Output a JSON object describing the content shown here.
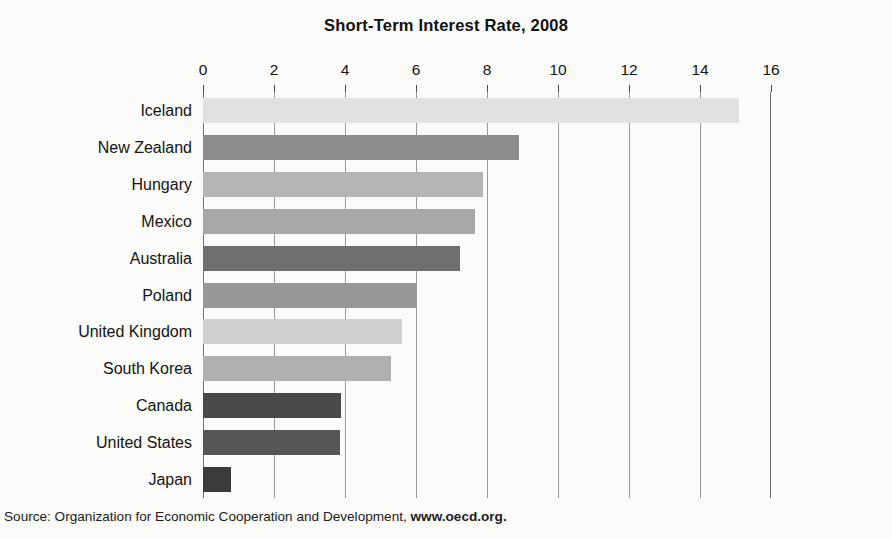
{
  "chart_data": {
    "type": "bar",
    "orientation": "horizontal",
    "title": "Short-Term Interest Rate, 2008",
    "xlabel": "",
    "ylabel": "",
    "xlim": [
      0,
      16
    ],
    "grid": true,
    "legend": false,
    "xticks": [
      "0",
      "2",
      "4",
      "6",
      "8",
      "10",
      "12",
      "14",
      "16"
    ],
    "xtick_values": [
      0,
      2,
      4,
      6,
      8,
      10,
      12,
      14,
      16
    ],
    "categories": [
      "Iceland",
      "New Zealand",
      "Hungary",
      "Mexico",
      "Australia",
      "Poland",
      "United Kingdom",
      "South Korea",
      "Canada",
      "United States",
      "Japan"
    ],
    "values": [
      15.1,
      8.9,
      7.9,
      7.65,
      7.25,
      6.0,
      5.6,
      5.3,
      3.9,
      3.85,
      0.8
    ],
    "bar_colors": [
      "#e2e2e2",
      "#8c8c8c",
      "#b5b5b5",
      "#a8a8a8",
      "#6e6e6e",
      "#979797",
      "#cfcfcf",
      "#b0b0b0",
      "#494949",
      "#565656",
      "#3b3b3b"
    ],
    "axis_color": "#6f6f6f",
    "gridline_color": "#9a9a9a"
  },
  "source": {
    "prefix": "Source: Organization for Economic Cooperation and Development, ",
    "url": "www.oecd.org."
  }
}
